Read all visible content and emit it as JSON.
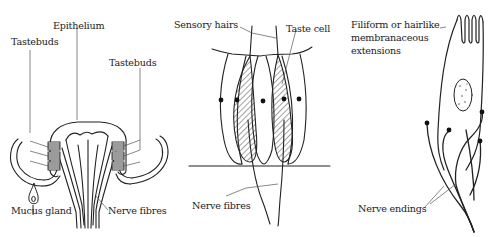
{
  "figure": {
    "panels": [
      {
        "id": "taste-papilla",
        "labels": {
          "tastebuds_left": "Tastebuds",
          "epithelium": "Epithelium",
          "tastebuds_right": "Tastebuds",
          "mucus_gland": "Mucus gland",
          "nerve_fibres": "Nerve fibres"
        }
      },
      {
        "id": "taste-bud",
        "labels": {
          "sensory_hairs": "Sensory hairs",
          "taste_cell": "Taste cell",
          "nerve_fibres": "Nerve fibres"
        }
      },
      {
        "id": "taste-cell",
        "labels": {
          "filiform_line1": "Filiform or hairlike",
          "filiform_line2": "membranaceous",
          "filiform_line3": "extensions",
          "nerve_endings": "Nerve endings"
        }
      }
    ],
    "colors": {
      "ink": "#222222",
      "background": "#ffffff"
    }
  }
}
